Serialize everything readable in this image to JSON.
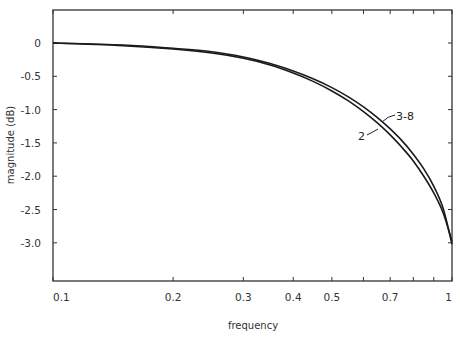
{
  "chart_data": {
    "type": "line",
    "title": "",
    "xlabel": "frequency",
    "ylabel": "magnitude  (dB)",
    "xscale": "log",
    "xlim": [
      0.1,
      1
    ],
    "ylim": [
      -3.5,
      0.5
    ],
    "grid": false,
    "legend": "inline labels on curves",
    "x_ticks": [
      0.1,
      0.2,
      0.3,
      0.4,
      0.5,
      0.6,
      0.7,
      0.8,
      0.9,
      1
    ],
    "x_tick_labels": [
      "0.1",
      "0.2",
      "0.3",
      "0.4",
      "0.5",
      "",
      "0.7",
      "",
      "",
      "1"
    ],
    "y_ticks": [
      0,
      -0.5,
      -1.0,
      -1.5,
      -2.0,
      -2.5,
      -3.0
    ],
    "y_tick_labels": [
      "0",
      "-0.5",
      "-1.0",
      "-1.5",
      "-2.0",
      "-2.5",
      "-3.0"
    ],
    "x": [
      0.1,
      0.15,
      0.2,
      0.25,
      0.3,
      0.35,
      0.4,
      0.45,
      0.5,
      0.55,
      0.6,
      0.65,
      0.7,
      0.75,
      0.8,
      0.85,
      0.9,
      0.95,
      1.0
    ],
    "series": [
      {
        "name": "2",
        "values": [
          0.0,
          -0.04,
          -0.09,
          -0.15,
          -0.23,
          -0.33,
          -0.45,
          -0.58,
          -0.72,
          -0.87,
          -1.03,
          -1.2,
          -1.38,
          -1.57,
          -1.77,
          -2.0,
          -2.25,
          -2.55,
          -2.98
        ]
      },
      {
        "name": "3-8",
        "values": [
          0.0,
          -0.03,
          -0.08,
          -0.13,
          -0.21,
          -0.31,
          -0.42,
          -0.54,
          -0.67,
          -0.81,
          -0.96,
          -1.12,
          -1.29,
          -1.47,
          -1.67,
          -1.89,
          -2.15,
          -2.48,
          -3.02
        ]
      }
    ],
    "annotations": [
      {
        "text": "3-8",
        "x": 0.68,
        "y": -1.08
      },
      {
        "text": "2",
        "x": 0.6,
        "y": -1.3
      }
    ]
  },
  "labels": {
    "xlabel": "frequency",
    "ylabel": "magnitude  (dB)",
    "series_2": "2",
    "series_3_8": "3-8"
  },
  "colors": {
    "line": "#1a1a1a",
    "axis": "#333333",
    "background": "#ffffff"
  }
}
